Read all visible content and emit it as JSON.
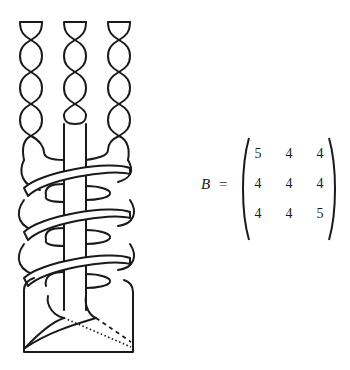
{
  "figure": {
    "strands": 3,
    "colors": {
      "stroke": "#1a1a1a",
      "background": "#ffffff"
    }
  },
  "equation": {
    "lhs": "B",
    "equals": "=",
    "matrix": [
      [
        "5",
        "4",
        "4"
      ],
      [
        "4",
        "4",
        "4"
      ],
      [
        "4",
        "4",
        "5"
      ]
    ]
  }
}
